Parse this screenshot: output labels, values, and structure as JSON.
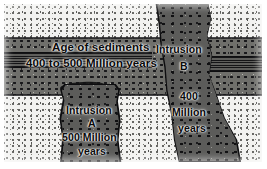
{
  "figure": {
    "kind": "geologic-cross-section",
    "caption_absent": true
  },
  "units": {
    "top_rock": {
      "name": "country-rock-upper",
      "texture": "light-stipple"
    },
    "sediment_band": {
      "name": "sedimentary-layer",
      "texture": "coarse-stipple",
      "title": "Age of sediments",
      "age_text": "400 to 500 Million years",
      "age_min_mya": 400,
      "age_max_mya": 500
    },
    "marker_bed": {
      "name": "marker-bed",
      "texture": "horizontal-hatch"
    },
    "bottom_rock": {
      "name": "country-rock-lower",
      "texture": "light-stipple"
    },
    "xenolith": {
      "name": "dark-lens-inclusion"
    }
  },
  "intrusions": {
    "a": {
      "name_label": "Intrusion",
      "letter": "A",
      "age_line1": "500 Million",
      "age_line2": "years",
      "age_mya": 500,
      "cuts_through": "lower unit only"
    },
    "b": {
      "name_label": "Intrusion",
      "letter": "B",
      "age_line1": "400",
      "age_line2": "Million",
      "age_line3": "years",
      "age_mya": 400,
      "cuts_through": "entire section"
    }
  },
  "colors": {
    "paper": "#ffffff",
    "light_rock": "#f2f2f0",
    "sediment": "#6f6f6b",
    "intrusion": "#5c5c5a",
    "marker_bed": "#3a3a38",
    "ink": "#0a0a0c"
  }
}
